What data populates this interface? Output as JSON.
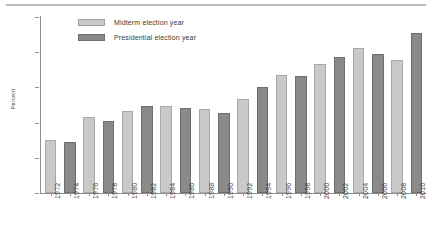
{
  "chart_data": {
    "type": "bar",
    "title": "",
    "xlabel": "",
    "ylabel": "Percent",
    "ylim": [
      0,
      25
    ],
    "yticks": [
      0,
      5,
      10,
      15,
      20,
      25
    ],
    "grid": false,
    "legend_position": "top-left-inside",
    "categories": [
      "1972",
      "1974",
      "1976",
      "1978",
      "1980",
      "1982",
      "1984",
      "1986",
      "1988",
      "1990",
      "1992",
      "1994",
      "1996",
      "1998",
      "2000",
      "2002",
      "2004",
      "2006",
      "2008",
      "2010"
    ],
    "values": [
      7.5,
      7.3,
      10.8,
      10.2,
      11.6,
      12.3,
      12.4,
      12.1,
      12.0,
      11.4,
      13.4,
      15.1,
      16.7,
      16.6,
      18.3,
      19.3,
      20.6,
      19.7,
      18.9,
      22.8
    ],
    "point_types": [
      "midterm",
      "presidential",
      "midterm",
      "presidential",
      "midterm",
      "presidential",
      "midterm",
      "presidential",
      "midterm",
      "presidential",
      "midterm",
      "presidential",
      "midterm",
      "presidential",
      "midterm",
      "presidential",
      "midterm",
      "presidential",
      "midterm",
      "presidential"
    ],
    "series": [
      {
        "name": "Midterm election year",
        "color": "#c9c9c9",
        "points": [
          {
            "x": "1972",
            "y": 7.5
          },
          {
            "x": "1976",
            "y": 10.8
          },
          {
            "x": "1980",
            "y": 11.6
          },
          {
            "x": "1984",
            "y": 12.4
          },
          {
            "x": "1988",
            "y": 12.0
          },
          {
            "x": "1992",
            "y": 13.4
          },
          {
            "x": "1996",
            "y": 16.7
          },
          {
            "x": "2000",
            "y": 18.3
          },
          {
            "x": "2004",
            "y": 20.6
          },
          {
            "x": "2008",
            "y": 18.9
          }
        ]
      },
      {
        "name": "Presidential election year",
        "color": "#8a8a8a",
        "points": [
          {
            "x": "1974",
            "y": 7.3
          },
          {
            "x": "1978",
            "y": 10.2
          },
          {
            "x": "1982",
            "y": 12.3
          },
          {
            "x": "1986",
            "y": 12.1
          },
          {
            "x": "1990",
            "y": 11.4
          },
          {
            "x": "1994",
            "y": 15.1
          },
          {
            "x": "1998",
            "y": 16.6
          },
          {
            "x": "2002",
            "y": 19.3
          },
          {
            "x": "2006",
            "y": 19.7
          },
          {
            "x": "2010",
            "y": 22.8
          }
        ]
      }
    ]
  },
  "legend": {
    "items": [
      {
        "label": "Midterm election year",
        "type": "midterm"
      },
      {
        "label": "Presidential election year",
        "type": "presidential"
      }
    ]
  },
  "axes": {
    "y_label": "Percent",
    "y_tick_labels": [
      "25",
      "20",
      "15",
      "10",
      "5",
      "0"
    ]
  }
}
